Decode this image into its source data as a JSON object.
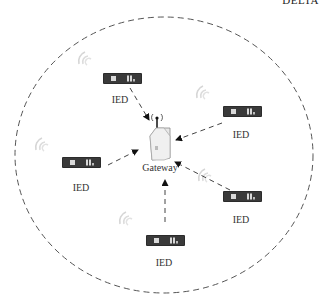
{
  "header": {
    "clipped_text": "DELTA"
  },
  "diagram": {
    "title": "",
    "gateway": {
      "label": "Gateway",
      "icon": "wireless-gateway-icon"
    },
    "ieds": [
      {
        "label": "IED",
        "icon": "ied-device-icon"
      },
      {
        "label": "IED",
        "icon": "ied-device-icon"
      },
      {
        "label": "IED",
        "icon": "ied-device-icon"
      },
      {
        "label": "IED",
        "icon": "ied-device-icon"
      },
      {
        "label": "IED",
        "icon": "ied-device-icon"
      }
    ],
    "boundary": "dashed-ellipse",
    "links": "dashed-arrows-to-gateway",
    "colors": {
      "stroke": "#444444",
      "device": "#2b2b2b",
      "wifi": "#cccccc"
    }
  }
}
